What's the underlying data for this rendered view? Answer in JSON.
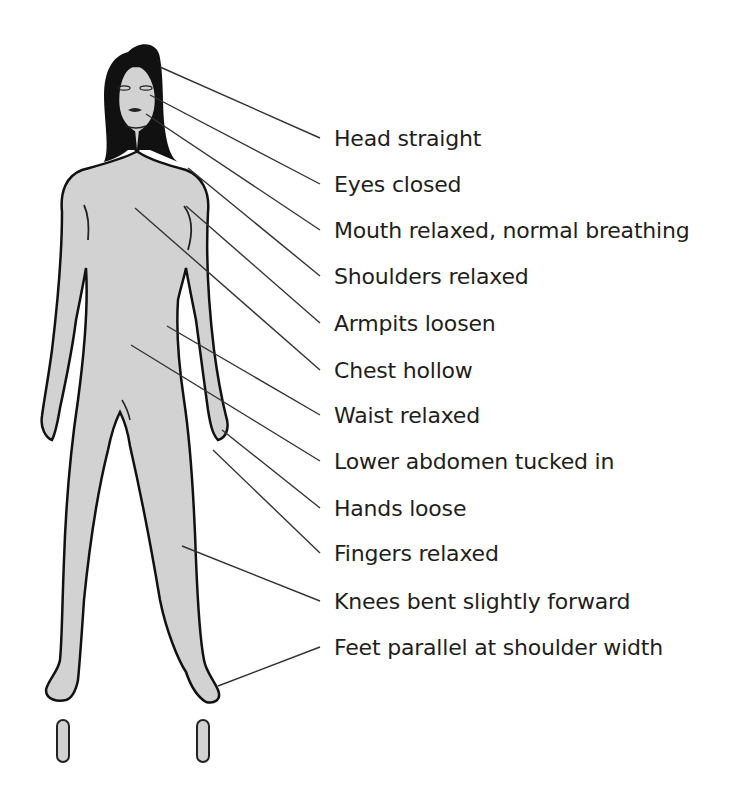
{
  "diagram": {
    "colors": {
      "body_fill": "#d2d2d2",
      "outline": "#111111",
      "leader_line": "#333333",
      "text": "#1e1e1e",
      "background": "#ffffff"
    },
    "labels": [
      {
        "text": "Head straight",
        "y": 126,
        "target": [
          160,
          67
        ]
      },
      {
        "text": "Eyes closed",
        "y": 172,
        "target": [
          150,
          95
        ]
      },
      {
        "text": "Mouth relaxed, normal breathing",
        "y": 218,
        "target": [
          146,
          114
        ]
      },
      {
        "text": "Shoulders relaxed",
        "y": 264,
        "target": [
          188,
          168
        ]
      },
      {
        "text": "Armpits loosen",
        "y": 311,
        "target": [
          186,
          206
        ]
      },
      {
        "text": "Chest hollow",
        "y": 358,
        "target": [
          135,
          208
        ]
      },
      {
        "text": "Waist relaxed",
        "y": 403,
        "target": [
          167,
          326
        ]
      },
      {
        "text": "Lower abdomen tucked in",
        "y": 449,
        "target": [
          131,
          345
        ]
      },
      {
        "text": "Hands loose",
        "y": 496,
        "target": [
          222,
          430
        ]
      },
      {
        "text": "Fingers relaxed",
        "y": 541,
        "target": [
          213,
          450
        ]
      },
      {
        "text": "Knees bent slightly forward",
        "y": 589,
        "target": [
          182,
          546
        ]
      },
      {
        "text": "Feet parallel at shoulder width",
        "y": 635,
        "target": [
          218,
          686
        ]
      }
    ]
  }
}
